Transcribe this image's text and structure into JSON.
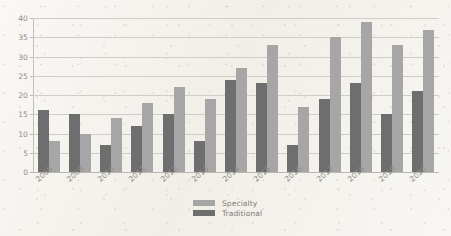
{
  "chart_data": {
    "type": "bar",
    "title": "",
    "subtitle": "",
    "xlabel": "",
    "ylabel": "",
    "ylim": [
      0,
      40
    ],
    "yticks": [
      0,
      5,
      10,
      15,
      20,
      25,
      30,
      35,
      40
    ],
    "grid": "horizontal",
    "legend_position": "bottom-center",
    "orientation": "vertical",
    "grouping": "grouped",
    "categories": [
      "2008",
      "2009",
      "2010",
      "2011",
      "2012",
      "2013",
      "2014",
      "2015",
      "2016",
      "2017",
      "2018",
      "2019",
      "2020"
    ],
    "series": [
      {
        "name": "Traditional",
        "color": "#6e6e6e",
        "draw_order": 1,
        "values": [
          16,
          15,
          7,
          12,
          15,
          8,
          24,
          23,
          7,
          19,
          23,
          15,
          21
        ]
      },
      {
        "name": "Specialty",
        "color": "#a6a6a6",
        "draw_order": 2,
        "values": [
          8,
          10,
          14,
          18,
          22,
          19,
          27,
          33,
          17,
          35,
          39,
          33,
          37
        ]
      }
    ],
    "legend": [
      {
        "label": "Specialty",
        "color": "#a6a6a6"
      },
      {
        "label": "Traditional",
        "color": "#6e6e6e"
      }
    ]
  },
  "colors": {
    "background": "#f3f0ea",
    "gridline": "#cfcdc7",
    "axis": "#b9b7b1",
    "tick_text": "#8d8b86",
    "legend_text": "#7e7c77",
    "series_traditional": "#6e6e6e",
    "series_specialty": "#a6a6a6"
  }
}
